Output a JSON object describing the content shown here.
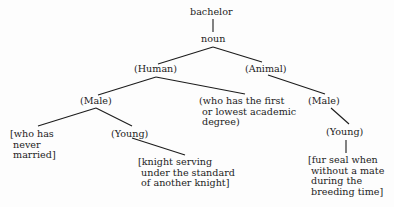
{
  "tree": {
    "root": "bachelor",
    "pos": "noun",
    "human": "(Human)",
    "animal": "(Animal)",
    "human_male": "(Male)",
    "academic": "(who has the first\n or lowest academic\n degree)",
    "never_married": "[who has\n never\n married]",
    "human_young": "(Young)",
    "knight": "[knight serving\n under the standard\n of another knight]",
    "animal_male": "(Male)",
    "animal_young": "(Young)",
    "fur_seal": "[fur seal when\n without a mate\n during the\n breeding time]"
  },
  "colors": {
    "line": "#1c1c1c",
    "text": "#1c1c1c",
    "background": "#fdfdfd"
  }
}
